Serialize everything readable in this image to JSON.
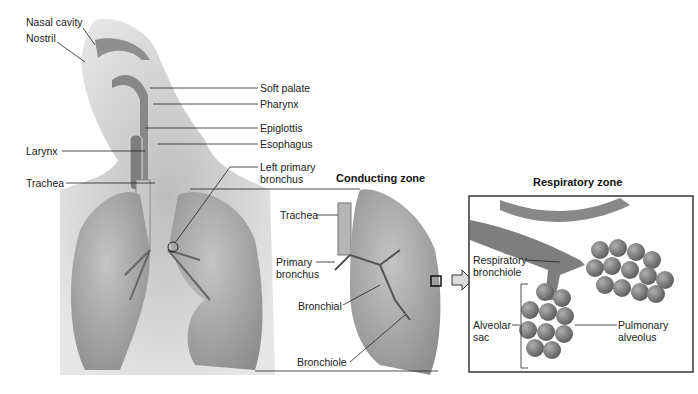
{
  "diagram": {
    "panels": {
      "conducting_title": "Conducting zone",
      "respiratory_title": "Respiratory zone"
    },
    "labels_left": {
      "nasal_cavity": "Nasal cavity",
      "nostril": "Nostril",
      "larynx": "Larynx",
      "trachea": "Trachea"
    },
    "labels_right": {
      "soft_palate": "Soft palate",
      "pharynx": "Pharynx",
      "epiglottis": "Epiglottis",
      "esophagus": "Esophagus",
      "left_primary_bronchus_1": "Left primary",
      "left_primary_bronchus_2": "bronchus"
    },
    "conducting_labels": {
      "trachea": "Trachea",
      "primary_bronchus_1": "Primary",
      "primary_bronchus_2": "bronchus",
      "bronchial": "Bronchial",
      "bronchiole": "Bronchiole"
    },
    "respiratory_labels": {
      "respiratory_bronchiole_1": "Respiratory",
      "respiratory_bronchiole_2": "bronchiole",
      "alveolar_sac_1": "Alveolar",
      "alveolar_sac_2": "sac",
      "pulmonary_alveolus_1": "Pulmonary",
      "pulmonary_alveolus_2": "alveolus"
    },
    "colors": {
      "background": "#ffffff",
      "tissue": "#9a9a9a",
      "lung": "#a8a8a8",
      "shadow": "#cfcfcf",
      "line": "#222222"
    }
  }
}
